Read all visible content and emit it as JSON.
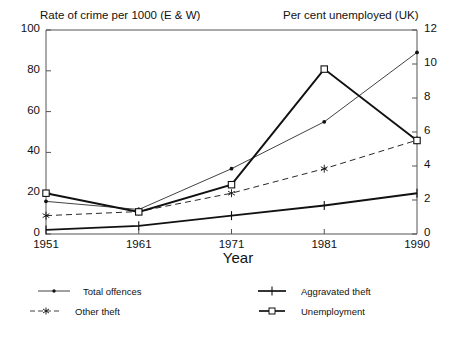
{
  "chart_data": {
    "type": "line",
    "title": "",
    "left_axis_title": "Rate of crime per 1000 (E & W)",
    "right_axis_title": "Per cent unemployed (UK)",
    "xlabel": "Year",
    "x": [
      1951,
      1961,
      1971,
      1981,
      1990
    ],
    "xtick_labels": [
      "1951",
      "1961",
      "1971",
      "1981",
      "1990"
    ],
    "left_ylim": [
      0,
      100
    ],
    "left_ticks": [
      0,
      20,
      40,
      60,
      80,
      100
    ],
    "left_tick_labels": [
      "0",
      "20",
      "40",
      "60",
      "80",
      "100"
    ],
    "right_ylim": [
      0,
      12
    ],
    "right_ticks": [
      0,
      2,
      4,
      6,
      8,
      10,
      12
    ],
    "right_tick_labels": [
      "0",
      "2",
      "4",
      "6",
      "8",
      "10",
      "12"
    ],
    "grid": false,
    "legend_position": "below",
    "series": [
      {
        "name": "Total offences",
        "axis": "left",
        "marker": "dot",
        "line": "solid-thin",
        "values": [
          16,
          12,
          32,
          55,
          89
        ]
      },
      {
        "name": "Other theft",
        "axis": "left",
        "marker": "asterisk",
        "line": "dashed",
        "values": [
          9,
          11,
          20,
          32,
          46
        ]
      },
      {
        "name": "Aggravated theft",
        "axis": "left",
        "marker": "plus",
        "line": "solid-thick",
        "values": [
          2,
          4,
          9,
          14,
          20
        ]
      },
      {
        "name": "Unemployment",
        "axis": "right",
        "marker": "square",
        "line": "solid-thick",
        "values": [
          2.4,
          1.3,
          2.9,
          9.7,
          5.5
        ],
        "values_left_scale": [
          20,
          11,
          24,
          81,
          46
        ]
      }
    ]
  },
  "legend": {
    "items": [
      {
        "label": "Total offences"
      },
      {
        "label": "Other theft"
      },
      {
        "label": "Aggravated theft"
      },
      {
        "label": "Unemployment"
      }
    ]
  },
  "colors": {
    "axis": "#555555",
    "line": "#111111",
    "background": "#ffffff"
  }
}
